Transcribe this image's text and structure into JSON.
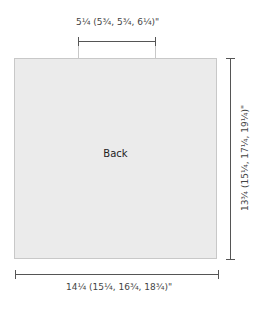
{
  "panel": {
    "label": "Back",
    "fill": "#ebebeb"
  },
  "dimensions": {
    "top_width": "5¼ (5¾, 5¾, 6¼)\"",
    "bottom_width": "14¼ (15¼, 16¾, 18¾)\"",
    "height": "13¾ (15¼, 17¼, 19¼)\""
  }
}
